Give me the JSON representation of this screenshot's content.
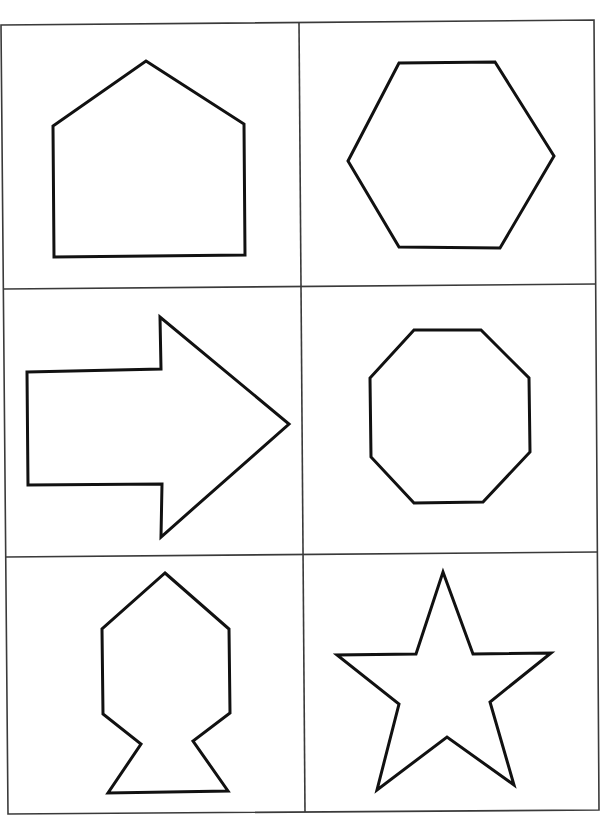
{
  "worksheet": {
    "grid": {
      "rows": 3,
      "columns": 2,
      "line_color": "#3a3a3a",
      "outer_border": [
        [
          1,
          25
        ],
        [
          594,
          20
        ],
        [
          599,
          810
        ],
        [
          8,
          814
        ]
      ],
      "vertical_divider": [
        [
          299,
          23
        ],
        [
          305,
          812
        ]
      ],
      "horizontal_dividers": [
        [
          [
            4,
            289
          ],
          [
            596,
            284
          ]
        ],
        [
          [
            6,
            557
          ],
          [
            598,
            552
          ]
        ]
      ]
    },
    "shapes": [
      {
        "name": "pentagon-house",
        "label": "pentagon",
        "row": 1,
        "column": 1,
        "points": [
          [
            146,
            61
          ],
          [
            244,
            124
          ],
          [
            245,
            255
          ],
          [
            54,
            257
          ],
          [
            53,
            126
          ]
        ]
      },
      {
        "name": "hexagon",
        "label": "hexagon",
        "row": 1,
        "column": 2,
        "points": [
          [
            399,
            63
          ],
          [
            495,
            62
          ],
          [
            554,
            156
          ],
          [
            500,
            248
          ],
          [
            399,
            247
          ],
          [
            348,
            161
          ]
        ]
      },
      {
        "name": "arrow",
        "label": "arrow",
        "row": 2,
        "column": 1,
        "points": [
          [
            27,
            372
          ],
          [
            161,
            369
          ],
          [
            160,
            317
          ],
          [
            289,
            424
          ],
          [
            161,
            537
          ],
          [
            162,
            484
          ],
          [
            28,
            485
          ]
        ]
      },
      {
        "name": "octagon",
        "label": "octagon",
        "row": 2,
        "column": 2,
        "points": [
          [
            414,
            330
          ],
          [
            481,
            330
          ],
          [
            529,
            378
          ],
          [
            530,
            452
          ],
          [
            483,
            502
          ],
          [
            414,
            503
          ],
          [
            371,
            457
          ],
          [
            370,
            378
          ]
        ]
      },
      {
        "name": "fish-shape",
        "label": "fish",
        "row": 3,
        "column": 1,
        "points": [
          [
            165,
            573
          ],
          [
            229,
            629
          ],
          [
            230,
            713
          ],
          [
            193,
            741
          ],
          [
            228,
            791
          ],
          [
            108,
            793
          ],
          [
            141,
            744
          ],
          [
            103,
            714
          ],
          [
            102,
            629
          ]
        ]
      },
      {
        "name": "star",
        "label": "star",
        "row": 3,
        "column": 2,
        "points": [
          [
            443,
            572
          ],
          [
            473,
            654
          ],
          [
            551,
            653
          ],
          [
            490,
            702
          ],
          [
            514,
            785
          ],
          [
            447,
            737
          ],
          [
            377,
            790
          ],
          [
            399,
            704
          ],
          [
            337,
            655
          ],
          [
            416,
            654
          ]
        ]
      }
    ],
    "stroke_color": "#111111",
    "stroke_width": 3
  }
}
